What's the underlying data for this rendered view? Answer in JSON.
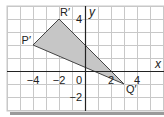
{
  "diagram": {
    "type": "coordinate-grid",
    "grid": {
      "x_min": -6,
      "x_max": 6,
      "y_min": -3,
      "y_max": 5,
      "unit_px": 13,
      "origin_px": [
        85,
        71
      ],
      "grid_color": "#c8c8c8",
      "axis_color": "#222222",
      "background": "#ffffff"
    },
    "axes": {
      "x_label": "x",
      "y_label": "y",
      "x_ticks": [
        {
          "value": -4,
          "label": "−4"
        },
        {
          "value": -2,
          "label": "−2"
        },
        {
          "value": 2,
          "label": "2"
        },
        {
          "value": 4,
          "label": "4"
        }
      ],
      "y_ticks": [
        {
          "value": 4,
          "label": "4"
        },
        {
          "value": -2,
          "label": "−2"
        }
      ],
      "origin_label": "0"
    },
    "shape": {
      "name": "triangle",
      "fill": "#c6c6c6",
      "stroke": "#444444",
      "vertices": [
        {
          "label": "P′",
          "x": -4,
          "y": 2
        },
        {
          "label": "R′",
          "x": -2,
          "y": 4
        },
        {
          "label": "Q′",
          "x": 3,
          "y": -1
        }
      ]
    }
  }
}
